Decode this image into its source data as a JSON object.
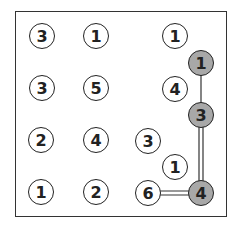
{
  "puzzle": {
    "type": "hashi",
    "selected_color": "#a8a8a8",
    "nodes": [
      {
        "value": "3",
        "x": 42,
        "y": 36,
        "selected": false
      },
      {
        "value": "1",
        "x": 96,
        "y": 36,
        "selected": false
      },
      {
        "value": "1",
        "x": 175,
        "y": 36,
        "selected": false
      },
      {
        "value": "1",
        "x": 201,
        "y": 63,
        "selected": true
      },
      {
        "value": "3",
        "x": 42,
        "y": 88,
        "selected": false
      },
      {
        "value": "5",
        "x": 96,
        "y": 88,
        "selected": false
      },
      {
        "value": "4",
        "x": 175,
        "y": 89,
        "selected": false
      },
      {
        "value": "3",
        "x": 201,
        "y": 115,
        "selected": true
      },
      {
        "value": "2",
        "x": 41,
        "y": 140,
        "selected": false
      },
      {
        "value": "4",
        "x": 96,
        "y": 140,
        "selected": false
      },
      {
        "value": "3",
        "x": 148,
        "y": 141,
        "selected": false
      },
      {
        "value": "1",
        "x": 175,
        "y": 167,
        "selected": false
      },
      {
        "value": "1",
        "x": 41,
        "y": 192,
        "selected": false
      },
      {
        "value": "2",
        "x": 96,
        "y": 192,
        "selected": false
      },
      {
        "value": "6",
        "x": 148,
        "y": 193,
        "selected": false
      },
      {
        "value": "4",
        "x": 201,
        "y": 193,
        "selected": true
      }
    ],
    "bridges": [
      {
        "from": 3,
        "to": 7,
        "count": 1
      },
      {
        "from": 7,
        "to": 15,
        "count": 2
      },
      {
        "from": 14,
        "to": 15,
        "count": 2
      }
    ]
  }
}
